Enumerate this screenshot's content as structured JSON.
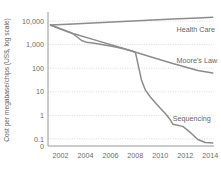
{
  "chart_data": {
    "type": "line",
    "title": "",
    "subtitle": "",
    "xlabel": "",
    "ylabel": "Cost per megabase/chips (US$, log scale)",
    "xlim": [
      2001,
      2014.3
    ],
    "ylim_log": [
      0.05,
      20000
    ],
    "grid": true,
    "legend_position": "inline-labels",
    "y_scale": "log",
    "x_ticks": [
      "2002",
      "2004",
      "2006",
      "2008",
      "2010",
      "2012",
      "2014"
    ],
    "x_tick_values": [
      2002,
      2004,
      2006,
      2008,
      2010,
      2012,
      2014
    ],
    "y_ticks": [
      "10,000",
      "1,000",
      "100",
      "10",
      "1",
      "0.1",
      "0"
    ],
    "y_tick_values": [
      10000,
      1000,
      100,
      10,
      1,
      0.1,
      0
    ],
    "series": [
      {
        "name": "Health Care",
        "label": "Health Care",
        "color": "#8c8c8c",
        "x": [
          2001.2,
          2003,
          2005,
          2007,
          2009,
          2011,
          2013,
          2014.2
        ],
        "values": [
          6800,
          7600,
          8600,
          9600,
          10800,
          12200,
          13600,
          14600
        ]
      },
      {
        "name": "Moore's Law",
        "label": "Moore's Law",
        "color": "#8c8c8c",
        "x": [
          2001.2,
          2003,
          2005,
          2007,
          2009,
          2011,
          2013,
          2014.2
        ],
        "values": [
          6800,
          3000,
          1450,
          700,
          330,
          160,
          80,
          62
        ]
      },
      {
        "name": "Sequencing",
        "label": "Sequencing",
        "color": "#8c8c8c",
        "x": [
          2001.2,
          2002,
          2003,
          2003.7,
          2004.1,
          2004.6,
          2005.2,
          2006,
          2006.6,
          2007.2,
          2007.7,
          2008.0,
          2008.25,
          2008.5,
          2008.8,
          2009.2,
          2009.6,
          2010.0,
          2010.4,
          2010.8,
          2011.0,
          2011.4,
          2011.8,
          2012.2,
          2012.6,
          2013.0,
          2013.3,
          2013.6,
          2014.0,
          2014.2
        ],
        "values": [
          6800,
          4600,
          2900,
          1500,
          1250,
          1180,
          1050,
          880,
          760,
          640,
          540,
          480,
          120,
          30,
          12,
          6,
          3.4,
          2.0,
          1.2,
          0.65,
          0.42,
          0.38,
          0.34,
          0.23,
          0.15,
          0.095,
          0.082,
          0.07,
          0.068,
          0.067
        ]
      }
    ],
    "annotations": [
      {
        "text": "Health Care",
        "x": 2011.3,
        "y": 3600
      },
      {
        "text": "Moore's Law",
        "x": 2011.3,
        "y": 160
      },
      {
        "text": "Sequencing",
        "x": 2011.0,
        "y": 0.55
      }
    ]
  }
}
